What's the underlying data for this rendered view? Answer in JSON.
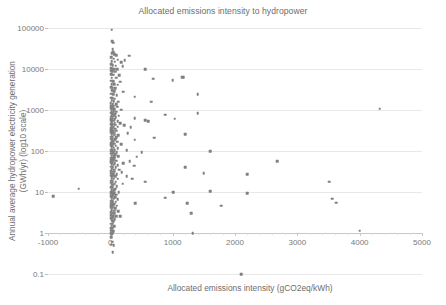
{
  "chart_data": {
    "type": "scatter",
    "title": "Allocated emissions intensity to hydropower",
    "xlabel": "Allocated emissions intensity (gCO2eq/kWh)",
    "ylabel_line1": "Annual average hydropower electricity generation",
    "ylabel_line2": "(GWh/yr) (log10 scale)",
    "ylabel": "Annual average hydropower electricity generation (GWh/yr) (log10 scale)",
    "xlim": [
      -1000,
      5000
    ],
    "ylim": [
      0.1,
      100000
    ],
    "yscale": "log10",
    "xscale": "linear",
    "xticks": [
      -1000,
      0,
      1000,
      2000,
      3000,
      4000,
      5000
    ],
    "xtick_labels": [
      "-1000",
      "0",
      "1000",
      "2000",
      "3000",
      "4000",
      "5000"
    ],
    "yticks": [
      0.1,
      1,
      10,
      100,
      1000,
      10000,
      100000
    ],
    "ytick_labels": [
      "0.1",
      "1",
      "10",
      "100",
      "1000",
      "10000",
      "100000"
    ],
    "grid": "horizontal",
    "legend": "none",
    "marker_color": "#808080",
    "marker_shape": "square",
    "gridline_color": "#e8e8e8",
    "axis_color": "#c8c8c8",
    "text_color": "#6e6e6e",
    "background_color": "#ffffff",
    "axis_line_at_y": 1,
    "series": [
      {
        "name": "Hydropower reservoirs",
        "points": [
          [
            20,
            90000
          ],
          [
            30,
            47000
          ],
          [
            42,
            44000
          ],
          [
            35,
            30000
          ],
          [
            48,
            26000
          ],
          [
            25,
            24000
          ],
          [
            60,
            23000
          ],
          [
            95,
            22000
          ],
          [
            300,
            21000
          ],
          [
            18,
            19500
          ],
          [
            55,
            18000
          ],
          [
            120,
            17000
          ],
          [
            230,
            16500
          ],
          [
            22,
            15500
          ],
          [
            70,
            15000
          ],
          [
            170,
            14500
          ],
          [
            15,
            13000
          ],
          [
            40,
            12500
          ],
          [
            88,
            12000
          ],
          [
            200,
            11800
          ],
          [
            12,
            10500
          ],
          [
            33,
            10200
          ],
          [
            62,
            10000
          ],
          [
            110,
            9800
          ],
          [
            560,
            10000
          ],
          [
            10,
            9000
          ],
          [
            28,
            8700
          ],
          [
            75,
            8500
          ],
          [
            16,
            7500
          ],
          [
            50,
            7200
          ],
          [
            140,
            7000
          ],
          [
            24,
            6200
          ],
          [
            95,
            6100
          ],
          [
            690,
            5800
          ],
          [
            1000,
            5400
          ],
          [
            1150,
            6400
          ],
          [
            1180,
            6300
          ],
          [
            14,
            5200
          ],
          [
            44,
            5000
          ],
          [
            160,
            4900
          ],
          [
            20,
            4300
          ],
          [
            66,
            4200
          ],
          [
            115,
            4100
          ],
          [
            11,
            3600
          ],
          [
            36,
            3500
          ],
          [
            82,
            3400
          ],
          [
            26,
            3000
          ],
          [
            58,
            2900
          ],
          [
            210,
            2800
          ],
          [
            1400,
            2400
          ],
          [
            17,
            2500
          ],
          [
            47,
            2400
          ],
          [
            100,
            2300
          ],
          [
            13,
            2000
          ],
          [
            31,
            1950
          ],
          [
            70,
            1900
          ],
          [
            390,
            2100
          ],
          [
            21,
            1700
          ],
          [
            54,
            1650
          ],
          [
            125,
            1600
          ],
          [
            660,
            1600
          ],
          [
            9,
            1450
          ],
          [
            38,
            1400
          ],
          [
            90,
            1380
          ],
          [
            16,
            1250
          ],
          [
            46,
            1220
          ],
          [
            108,
            1200
          ],
          [
            4320,
            1080
          ],
          [
            12,
            1100
          ],
          [
            29,
            1080
          ],
          [
            64,
            1050
          ],
          [
            175,
            1020
          ],
          [
            19,
            950
          ],
          [
            52,
            930
          ],
          [
            98,
            910
          ],
          [
            8,
            850
          ],
          [
            34,
            830
          ],
          [
            78,
            810
          ],
          [
            1400,
            830
          ],
          [
            23,
            750
          ],
          [
            60,
            740
          ],
          [
            135,
            730
          ],
          [
            880,
            760
          ],
          [
            14,
            690
          ],
          [
            41,
            680
          ],
          [
            88,
            670
          ],
          [
            390,
            640
          ],
          [
            10,
            620
          ],
          [
            30,
            610
          ],
          [
            70,
            600
          ],
          [
            1030,
            610
          ],
          [
            18,
            560
          ],
          [
            49,
            550
          ],
          [
            115,
            540
          ],
          [
            560,
            560
          ],
          [
            610,
            540
          ],
          [
            25,
            500
          ],
          [
            68,
            490
          ],
          [
            160,
            480
          ],
          [
            13,
            450
          ],
          [
            36,
            445
          ],
          [
            82,
            440
          ],
          [
            220,
            430
          ],
          [
            20,
            400
          ],
          [
            55,
            395
          ],
          [
            120,
            390
          ],
          [
            330,
            385
          ],
          [
            9,
            360
          ],
          [
            32,
            355
          ],
          [
            75,
            350
          ],
          [
            16,
            320
          ],
          [
            44,
            315
          ],
          [
            98,
            310
          ],
          [
            1200,
            260
          ],
          [
            11,
            290
          ],
          [
            28,
            285
          ],
          [
            63,
            280
          ],
          [
            280,
            270
          ],
          [
            22,
            255
          ],
          [
            58,
            250
          ],
          [
            130,
            245
          ],
          [
            700,
            210
          ],
          [
            15,
            225
          ],
          [
            40,
            222
          ],
          [
            90,
            218
          ],
          [
            12,
            200
          ],
          [
            34,
            198
          ],
          [
            76,
            195
          ],
          [
            390,
            190
          ],
          [
            19,
            175
          ],
          [
            50,
            172
          ],
          [
            110,
            170
          ],
          [
            8,
            155
          ],
          [
            26,
            152
          ],
          [
            60,
            150
          ],
          [
            175,
            148
          ],
          [
            14,
            138
          ],
          [
            38,
            136
          ],
          [
            85,
            134
          ],
          [
            21,
            122
          ],
          [
            54,
            120
          ],
          [
            120,
            118
          ],
          [
            1600,
            100
          ],
          [
            10,
            108
          ],
          [
            30,
            106
          ],
          [
            68,
            105
          ],
          [
            260,
            103
          ],
          [
            17,
            96
          ],
          [
            46,
            95
          ],
          [
            100,
            94
          ],
          [
            500,
            92
          ],
          [
            13,
            86
          ],
          [
            35,
            85
          ],
          [
            78,
            84
          ],
          [
            23,
            76
          ],
          [
            58,
            75
          ],
          [
            130,
            74
          ],
          [
            420,
            72
          ],
          [
            9,
            68
          ],
          [
            28,
            67
          ],
          [
            64,
            66
          ],
          [
            16,
            60
          ],
          [
            42,
            59
          ],
          [
            95,
            58
          ],
          [
            310,
            57
          ],
          [
            2680,
            57
          ],
          [
            11,
            53
          ],
          [
            32,
            52
          ],
          [
            72,
            51
          ],
          [
            210,
            50
          ],
          [
            20,
            47
          ],
          [
            52,
            46
          ],
          [
            115,
            45
          ],
          [
            380,
            44
          ],
          [
            14,
            41
          ],
          [
            37,
            40
          ],
          [
            84,
            40
          ],
          [
            1200,
            40
          ],
          [
            25,
            36
          ],
          [
            62,
            35
          ],
          [
            140,
            35
          ],
          [
            8,
            32
          ],
          [
            29,
            31
          ],
          [
            66,
            31
          ],
          [
            180,
            30
          ],
          [
            1500,
            29
          ],
          [
            18,
            28
          ],
          [
            46,
            27
          ],
          [
            100,
            27
          ],
          [
            2200,
            27
          ],
          [
            12,
            25
          ],
          [
            34,
            24
          ],
          [
            76,
            24
          ],
          [
            260,
            24
          ],
          [
            22,
            22
          ],
          [
            55,
            21
          ],
          [
            120,
            21
          ],
          [
            350,
            21
          ],
          [
            15,
            19
          ],
          [
            40,
            19
          ],
          [
            88,
            18
          ],
          [
            560,
            18
          ],
          [
            3510,
            18
          ],
          [
            10,
            17
          ],
          [
            30,
            17
          ],
          [
            68,
            16
          ],
          [
            200,
            16
          ],
          [
            19,
            15
          ],
          [
            48,
            15
          ],
          [
            105,
            14
          ],
          [
            13,
            13
          ],
          [
            36,
            13
          ],
          [
            80,
            12
          ],
          [
            -510,
            12
          ],
          [
            24,
            11
          ],
          [
            60,
            11
          ],
          [
            135,
            10
          ],
          [
            1010,
            10
          ],
          [
            1600,
            10.5
          ],
          [
            9,
            10
          ],
          [
            28,
            10
          ],
          [
            64,
            9.5
          ],
          [
            2200,
            9.3
          ],
          [
            17,
            9
          ],
          [
            44,
            8.8
          ],
          [
            96,
            8.5
          ],
          [
            -920,
            8
          ],
          [
            12,
            8
          ],
          [
            33,
            7.8
          ],
          [
            74,
            7.5
          ],
          [
            880,
            7.2
          ],
          [
            21,
            7
          ],
          [
            52,
            6.8
          ],
          [
            115,
            6.6
          ],
          [
            3560,
            6.8
          ],
          [
            15,
            6.2
          ],
          [
            38,
            6
          ],
          [
            86,
            5.8
          ],
          [
            1230,
            5.4
          ],
          [
            3620,
            5.5
          ],
          [
            10,
            5.5
          ],
          [
            29,
            5.3
          ],
          [
            66,
            5.2
          ],
          [
            400,
            5.4
          ],
          [
            18,
            4.8
          ],
          [
            46,
            4.7
          ],
          [
            100,
            4.6
          ],
          [
            1780,
            4.6
          ],
          [
            13,
            4.2
          ],
          [
            34,
            4.1
          ],
          [
            78,
            4
          ],
          [
            23,
            3.6
          ],
          [
            58,
            3.5
          ],
          [
            130,
            3.4
          ],
          [
            8,
            3.2
          ],
          [
            27,
            3.1
          ],
          [
            62,
            3
          ],
          [
            1300,
            3
          ],
          [
            16,
            2.7
          ],
          [
            42,
            2.6
          ],
          [
            92,
            2.6
          ],
          [
            160,
            2.6
          ],
          [
            11,
            2.3
          ],
          [
            31,
            2.3
          ],
          [
            70,
            2.2
          ],
          [
            20,
            2
          ],
          [
            50,
            1.95
          ],
          [
            14,
            1.7
          ],
          [
            37,
            1.7
          ],
          [
            25,
            1.5
          ],
          [
            60,
            1.45
          ],
          [
            9,
            1.3
          ],
          [
            29,
            1.3
          ],
          [
            17,
            1.15
          ],
          [
            45,
            1.12
          ],
          [
            12,
            1.0
          ],
          [
            33,
            1.0
          ],
          [
            4000,
            1.15
          ],
          [
            22,
            0.92
          ],
          [
            15,
            0.78
          ],
          [
            1320,
            1.0
          ],
          [
            28,
            0.62
          ],
          [
            18,
            0.52
          ],
          [
            55,
            0.5
          ],
          [
            35,
            0.34
          ],
          [
            2100,
            0.1
          ]
        ]
      }
    ]
  }
}
